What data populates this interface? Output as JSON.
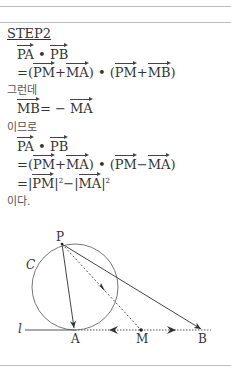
{
  "title": "STEP2",
  "lines": [
    {
      "type": "math",
      "parts": [
        "PA",
        "•",
        "PB"
      ]
    },
    {
      "text": "= (PM + MA) • (PM + MB)"
    },
    {
      "kr": "그런데"
    },
    {
      "text": "MB = − MA"
    },
    {
      "kr": "이므로"
    },
    {
      "type": "math",
      "parts": [
        "PA",
        "•",
        "PB"
      ]
    },
    {
      "text": "= (PM + MA) • (PM − MA)"
    },
    {
      "text": "= |PM|² − |MA|²"
    },
    {
      "kr": "이다."
    }
  ],
  "text": {
    "l1_a": "PA",
    "l1_dot": "•",
    "l1_b": "PB",
    "l2_eq": "=",
    "l2_open": "(",
    "l2_pm": "PM",
    "l2_plus": "+",
    "l2_ma": "MA",
    "l2_close": ")",
    "l2_dot": "•",
    "l2_open2": "(",
    "l2_pm2": "PM",
    "l2_plus2": "+",
    "l2_mb": "MB",
    "l2_close2": ")",
    "kr1": "그런데",
    "l3_mb": "MB",
    "l3_eq": "= −",
    "l3_ma": "MA",
    "kr2": "이므로",
    "l4_a": "PA",
    "l4_dot": "•",
    "l4_b": "PB",
    "l5_eq": "=",
    "l5_open": "(",
    "l5_pm": "PM",
    "l5_plus": "+",
    "l5_ma": "MA",
    "l5_close": ")",
    "l5_dot": "•",
    "l5_open2": "(",
    "l5_pm2": "PM",
    "l5_minus": "−",
    "l5_ma2": "MA",
    "l5_close2": ")",
    "l6_eq": "=",
    "l6_bar1": "|",
    "l6_pm": "PM",
    "l6_bar2": "|",
    "l6_sq1": "2",
    "l6_minus": "−",
    "l6_bar3": "|",
    "l6_ma": "MA",
    "l6_bar4": "|",
    "l6_sq2": "2",
    "kr3": "이다."
  },
  "diagram": {
    "labels": {
      "P": "P",
      "C": "C",
      "l": "l",
      "A": "A",
      "M": "M",
      "B": "B"
    }
  }
}
